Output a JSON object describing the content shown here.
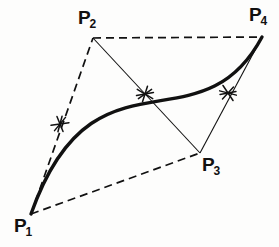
{
  "figure": {
    "background_color": "#fdfdfc",
    "ink_color": "#111111",
    "width": 279,
    "height": 247
  },
  "labels": {
    "p1": {
      "base": "P",
      "sub": "1"
    },
    "p2": {
      "base": "P",
      "sub": "2"
    },
    "p3": {
      "base": "P",
      "sub": "3"
    },
    "p4": {
      "base": "P",
      "sub": "4"
    }
  },
  "chart_data": {
    "type": "scatter",
    "xlabel": "",
    "ylabel": "",
    "xlim": [
      0,
      279
    ],
    "ylim": [
      247,
      0
    ],
    "grid": false,
    "legend": null,
    "control_points": [
      {
        "name": "P1",
        "x": 31,
        "y": 214,
        "label": "P1",
        "label_x": 14,
        "label_y": 216
      },
      {
        "name": "P2",
        "x": 93,
        "y": 38,
        "label": "P2",
        "label_x": 78,
        "label_y": 8
      },
      {
        "name": "P3",
        "x": 200,
        "y": 153,
        "label": "P3",
        "label_x": 202,
        "label_y": 155
      },
      {
        "name": "P4",
        "x": 262,
        "y": 37,
        "label": "P4",
        "label_x": 249,
        "label_y": 5
      }
    ],
    "curve": {
      "name": "bezier-curve",
      "style": "thick-solid",
      "stroke_width": 3.4,
      "start": [
        31,
        214
      ],
      "control1": [
        93,
        38
      ],
      "control2": [
        200,
        153
      ],
      "end": [
        262,
        37
      ],
      "path": "M 31 214 C 93 38 200 153 262 37",
      "peak": [
        97,
        71
      ],
      "trough": [
        190,
        124
      ]
    },
    "polygon_edges": [
      {
        "name": "p1-p2",
        "from": "P1",
        "to": "P2",
        "style": "dashed",
        "x1": 31,
        "y1": 214,
        "x2": 93,
        "y2": 38
      },
      {
        "name": "p2-p4",
        "from": "P2",
        "to": "P4",
        "style": "dashed",
        "x1": 93,
        "y1": 38,
        "x2": 262,
        "y2": 37
      },
      {
        "name": "p1-p3",
        "from": "P1",
        "to": "P3",
        "style": "dashed",
        "x1": 31,
        "y1": 214,
        "x2": 200,
        "y2": 153
      },
      {
        "name": "p2-p3",
        "from": "P2",
        "to": "P3",
        "style": "thin-solid",
        "x1": 93,
        "y1": 38,
        "x2": 200,
        "y2": 153
      },
      {
        "name": "p3-p4",
        "from": "P3",
        "to": "P4",
        "style": "thin-solid",
        "x1": 200,
        "y1": 153,
        "x2": 262,
        "y2": 37
      }
    ],
    "tick_marks": [
      {
        "name": "tick-1",
        "x": 60,
        "y": 124,
        "angle_deg": -15
      },
      {
        "name": "tick-2",
        "x": 145,
        "y": 94,
        "angle_deg": 25
      },
      {
        "name": "tick-3",
        "x": 228,
        "y": 93,
        "angle_deg": 50
      }
    ]
  }
}
